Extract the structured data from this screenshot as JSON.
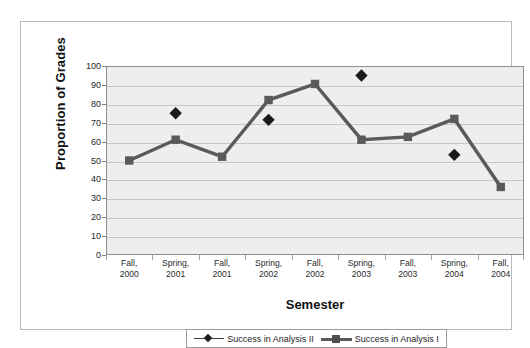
{
  "page": {
    "bleed_artifacts": [
      "",
      "",
      ""
    ]
  },
  "chart_data": {
    "type": "line",
    "title": "",
    "xlabel": "Semester",
    "ylabel": "Proportion of Grades",
    "categories": [
      "Fall, 2000",
      "Spring, 2001",
      "Fall, 2001",
      "Spring, 2002",
      "Fall, 2002",
      "Spring, 2003",
      "Fall, 2003",
      "Spring, 2004",
      "Fall, 2004"
    ],
    "category_lines": [
      [
        "Fall,",
        "2000"
      ],
      [
        "Spring,",
        "2001"
      ],
      [
        "Fall,",
        "2001"
      ],
      [
        "Spring,",
        "2002"
      ],
      [
        "Fall,",
        "2002"
      ],
      [
        "Spring,",
        "2003"
      ],
      [
        "Fall,",
        "2003"
      ],
      [
        "Spring,",
        "2004"
      ],
      [
        "Fall,",
        "2004"
      ]
    ],
    "ylim": [
      0,
      100
    ],
    "ytick_values": [
      100,
      90,
      80,
      70,
      60,
      50,
      40,
      30,
      20,
      10,
      0
    ],
    "grid": true,
    "grid_axis": "y",
    "legend_position": "bottom",
    "series": [
      {
        "name": "Success in Analysis II",
        "marker": "diamond",
        "line": false,
        "color": "#1a1a1a",
        "values": [
          null,
          75,
          null,
          71.5,
          null,
          95,
          null,
          53,
          null
        ]
      },
      {
        "name": "Success in Analysis I",
        "marker": "square",
        "line": true,
        "color": "#5a5a5a",
        "values": [
          50,
          61,
          52,
          82,
          90.5,
          61,
          62.5,
          72,
          36
        ]
      }
    ]
  },
  "colors": {
    "plot_background": "#eeeeee",
    "gridline": "#c8c8c8",
    "frame_border": "#b9b9b9",
    "axis_border": "#8e8e8e",
    "series_analysis_i": "#5a5a5a",
    "series_analysis_ii": "#1a1a1a"
  }
}
